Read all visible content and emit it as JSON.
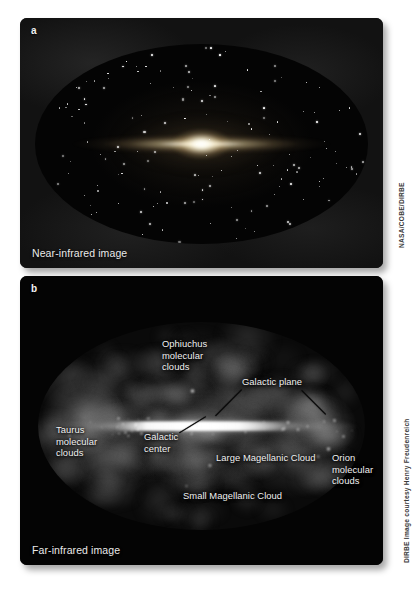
{
  "figure": {
    "background_color": "#ffffff",
    "panels": [
      {
        "letter": "a",
        "caption": "Near-infrared image",
        "credit": "NASA/COBE/DIRBE"
      },
      {
        "letter": "b",
        "caption": "Far-infrared image",
        "credit": "DIRBE Image courtesy Henry Freudenreich"
      }
    ]
  },
  "panel_a": {
    "letter": "a",
    "caption": "Near-infrared image",
    "credit": "NASA/COBE/DIRBE"
  },
  "panel_b": {
    "letter": "b",
    "caption": "Far-infrared image",
    "credit": "DIRBE Image courtesy Henry Freudenreich",
    "annotations": [
      {
        "id": "ophiuchus",
        "label": "Ophiuchus\nmolecular\nclouds"
      },
      {
        "id": "galactic-plane",
        "label": "Galactic plane"
      },
      {
        "id": "taurus",
        "label": "Taurus\nmolecular\nclouds"
      },
      {
        "id": "galactic-center",
        "label": "Galactic\ncenter"
      },
      {
        "id": "lmc",
        "label": "Large Magellanic Cloud"
      },
      {
        "id": "orion",
        "label": "Orion\nmolecular\nclouds"
      },
      {
        "id": "smc",
        "label": "Small Magellanic Cloud"
      }
    ]
  },
  "colors": {
    "page_background": "#ffffff",
    "panel_background": "#090909",
    "label_text": "#f0f0f0",
    "credit_text": "#3a3a3a",
    "leader_line": "#0a0a0a"
  }
}
